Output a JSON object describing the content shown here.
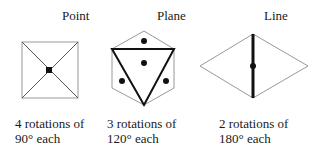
{
  "panels": [
    {
      "title": "Point",
      "caption_line1": "4 rotations of",
      "caption_line2": "90° each"
    },
    {
      "title": "Plane",
      "caption_line1": "3 rotations of",
      "caption_line2": "120° each"
    },
    {
      "title": "Line",
      "caption_line1": "2 rotations of",
      "caption_line2": "180° each"
    }
  ],
  "colors": {
    "thin_line": "#999999",
    "thick_line": "#111111",
    "dot": "#111111"
  }
}
